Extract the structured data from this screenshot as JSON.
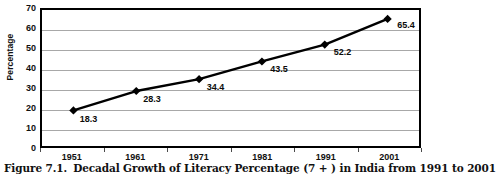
{
  "figure": {
    "caption_number": "Figure 7.1.",
    "caption_text": "Decadal Growth of Literacy Percentage (7 + ) in India from 1991 to 2001"
  },
  "chart_data": {
    "type": "line",
    "title": "",
    "subtitle": "",
    "xlabel": "",
    "ylabel": "Percentage",
    "categories": [
      "1951",
      "1961",
      "1971",
      "1981",
      "1991",
      "2001"
    ],
    "values": [
      18.3,
      28.3,
      34.4,
      43.5,
      52.2,
      65.4
    ],
    "point_labels": [
      "18.3",
      "28.3",
      "34.4",
      "43.5",
      "52.2",
      "65.4"
    ],
    "series": [
      {
        "name": "Literacy Percentage",
        "values": [
          18.3,
          28.3,
          34.4,
          43.5,
          52.2,
          65.4
        ],
        "color": "#000000",
        "marker": "diamond"
      }
    ],
    "ylim": [
      0,
      70
    ],
    "ytick_step": 10,
    "yticks": [
      "70",
      "60",
      "50",
      "40",
      "30",
      "20",
      "10",
      "0"
    ],
    "grid": "horizontal",
    "legend": "none",
    "plot_border_color": "#000000",
    "gridline_color": "#a8a8a8",
    "background": "#ffffff"
  }
}
